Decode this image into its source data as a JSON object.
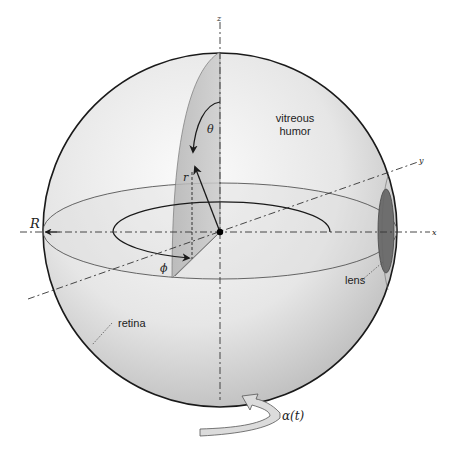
{
  "figure": {
    "axes": {
      "x_label": "x",
      "y_label": "y",
      "z_label": "z"
    },
    "symbols": {
      "radius_label": "R",
      "r_label": "r",
      "theta_label": "θ",
      "phi_label": "ϕ",
      "rotation_label": "α(t)"
    },
    "annotations": {
      "vitreous_line1": "vitreous",
      "vitreous_line2": "humor",
      "lens": "lens",
      "retina": "retina"
    },
    "colors": {
      "sphere_light": "#f4f4f4",
      "sphere_dark": "#c8c8c8",
      "meridian_fill": "#bdbdbd",
      "lens_fill": "#6e6e6e",
      "outline": "#1a1a1a",
      "rotation_arrow_fill": "#dcdcdc"
    }
  }
}
